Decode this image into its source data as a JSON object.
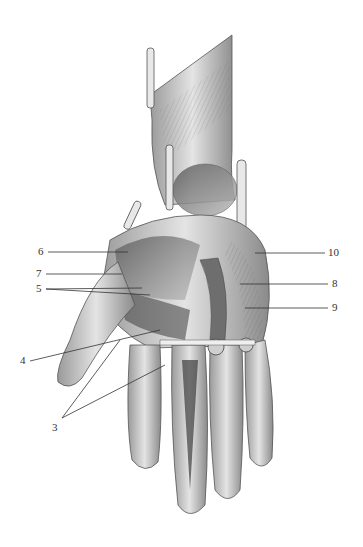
{
  "figure": {
    "style": "graphite pencil illustration",
    "colors": {
      "background": "#ffffff",
      "ink": "#3a3a3a",
      "shade": "#7a7a7a",
      "light": "#d8d8d8"
    }
  },
  "labels": [
    {
      "id": "6",
      "text": "6",
      "x": 38,
      "y": 248,
      "lines": [
        [
          48,
          252,
          128,
          252
        ]
      ]
    },
    {
      "id": "7",
      "text": "7",
      "x": 36,
      "y": 270,
      "lines": [
        [
          46,
          274,
          122,
          274
        ]
      ]
    },
    {
      "id": "5",
      "text": "5",
      "x": 36,
      "y": 285,
      "lines": [
        [
          46,
          289,
          142,
          288
        ],
        [
          46,
          289,
          150,
          295
        ]
      ]
    },
    {
      "id": "4",
      "text": "4",
      "x": 20,
      "y": 357,
      "lines": [
        [
          30,
          361,
          160,
          330
        ]
      ]
    },
    {
      "id": "3",
      "text": "3",
      "x": 52,
      "y": 424,
      "lines": [
        [
          62,
          418,
          120,
          340
        ],
        [
          62,
          418,
          165,
          365
        ]
      ]
    },
    {
      "id": "10",
      "text": "10",
      "x": 328,
      "y": 249,
      "lines": [
        [
          255,
          253,
          325,
          253
        ]
      ]
    },
    {
      "id": "8",
      "text": "8",
      "x": 332,
      "y": 280,
      "lines": [
        [
          240,
          284,
          328,
          284
        ]
      ]
    },
    {
      "id": "9",
      "text": "9",
      "x": 332,
      "y": 304,
      "lines": [
        [
          245,
          308,
          328,
          308
        ]
      ]
    }
  ]
}
